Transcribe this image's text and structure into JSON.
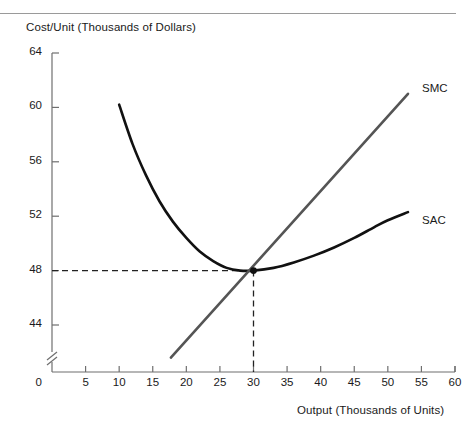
{
  "chart_data": {
    "type": "line",
    "title": "",
    "ylabel": "Cost/Unit (Thousands of Dollars)",
    "xlabel": "Output (Thousands of Units)",
    "xlim": [
      0,
      60
    ],
    "ylim": [
      42,
      64
    ],
    "y_axis_break": true,
    "y_axis_break_label": "0",
    "grid": false,
    "legend": "inline-labels",
    "xticks": [
      0,
      5,
      10,
      15,
      20,
      25,
      30,
      35,
      40,
      45,
      50,
      55,
      60
    ],
    "xtick_labels": [
      "0",
      "5",
      "10",
      "15",
      "20",
      "25",
      "30",
      "35",
      "40",
      "45",
      "50",
      "55",
      "60"
    ],
    "yticks": [
      44,
      48,
      52,
      56,
      60,
      64
    ],
    "ytick_labels": [
      "44",
      "48",
      "52",
      "56",
      "60",
      "64"
    ],
    "series": [
      {
        "name": "SAC",
        "label": "SAC",
        "color": "#111111",
        "style": "solid",
        "width": 2.6,
        "x": [
          10,
          12,
          14,
          16,
          18,
          20,
          22,
          24,
          26,
          28,
          30,
          33,
          36,
          39,
          42,
          45,
          48,
          50,
          53
        ],
        "y": [
          60.2,
          57.3,
          55.0,
          53.1,
          51.6,
          50.4,
          49.4,
          48.7,
          48.2,
          48.0,
          48.0,
          48.2,
          48.6,
          49.1,
          49.7,
          50.4,
          51.2,
          51.7,
          52.3
        ]
      },
      {
        "name": "SMC",
        "label": "SMC",
        "color": "#555555",
        "style": "solid",
        "width": 2.6,
        "x": [
          17.7,
          53.0
        ],
        "y": [
          41.6,
          61.0
        ]
      }
    ],
    "annotations": [
      {
        "name": "equilibrium-point",
        "x": 30,
        "y": 48,
        "marker": "dot",
        "color": "#111111"
      },
      {
        "name": "horizontal-guide",
        "style": "dashed",
        "from": [
          0,
          48
        ],
        "to": [
          30,
          48
        ],
        "color": "#222222"
      },
      {
        "name": "vertical-guide",
        "style": "dashed",
        "from": [
          30,
          48
        ],
        "to": [
          30,
          41.6
        ],
        "color": "#222222"
      }
    ],
    "curve_labels": [
      {
        "text": "SMC",
        "x": 54.5,
        "y": 61.3
      },
      {
        "text": "SAC",
        "x": 54.5,
        "y": 51.6
      }
    ]
  }
}
